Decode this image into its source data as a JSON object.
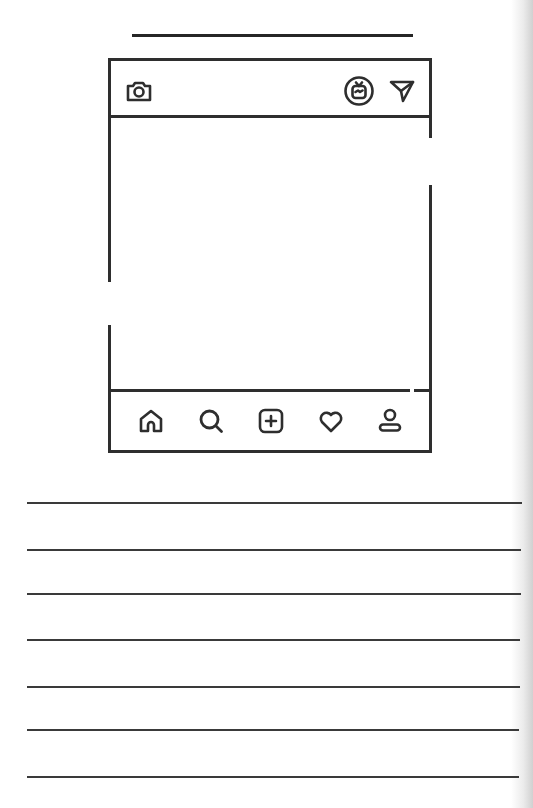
{
  "page": {
    "background": "#ffffff",
    "ink_color": "#2e2e2e"
  },
  "title_line": {
    "description": "blank line for handwritten title"
  },
  "phone_mockup": {
    "header_icons": [
      {
        "name": "camera-icon"
      },
      {
        "name": "igtv-icon"
      },
      {
        "name": "send-direct-icon"
      }
    ],
    "nav_icons": [
      {
        "name": "home-icon"
      },
      {
        "name": "search-icon"
      },
      {
        "name": "add-post-icon"
      },
      {
        "name": "heart-icon"
      },
      {
        "name": "profile-icon"
      }
    ],
    "post_area": "blank"
  },
  "writing_lines": {
    "count": 7,
    "y_positions": [
      503,
      550,
      594,
      640,
      687,
      730,
      777
    ]
  }
}
